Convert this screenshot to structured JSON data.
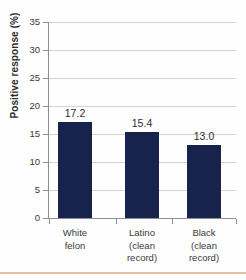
{
  "chart_data": {
    "type": "bar",
    "title": "",
    "subtitle": "",
    "xlabel": "",
    "ylabel": "Positive response (%)",
    "ylim": [
      0,
      35
    ],
    "ytick_step": 5,
    "yticks": [
      35,
      30,
      25,
      20,
      15,
      10,
      5,
      0
    ],
    "ytick_labels": [
      "35",
      "30",
      "25",
      "20",
      "15",
      "10",
      "5",
      "0"
    ],
    "categories": [
      "White\nfelon",
      "Latino\n(clean\nrecord)",
      "Black\n(clean\nrecord)"
    ],
    "values": [
      17.2,
      15.4,
      13.0
    ],
    "value_labels": [
      "17.2",
      "15.4",
      "13.0"
    ],
    "grid": true,
    "grid_axis": "y",
    "legend": false,
    "legend_position": "none",
    "bar_color": "#17224d",
    "grid_color": "#d4d4d4",
    "axis_color": "#8e8e8e",
    "text_color": "#3a3a3a",
    "accent_rule_color": "#e5bfa4",
    "bars": [
      {
        "category": "White felon",
        "value": 17.2,
        "label": "17.2"
      },
      {
        "category": "Latino (clean record)",
        "value": 15.4,
        "label": "15.4"
      },
      {
        "category": "Black (clean record)",
        "value": 13.0,
        "label": "13.0"
      }
    ]
  }
}
